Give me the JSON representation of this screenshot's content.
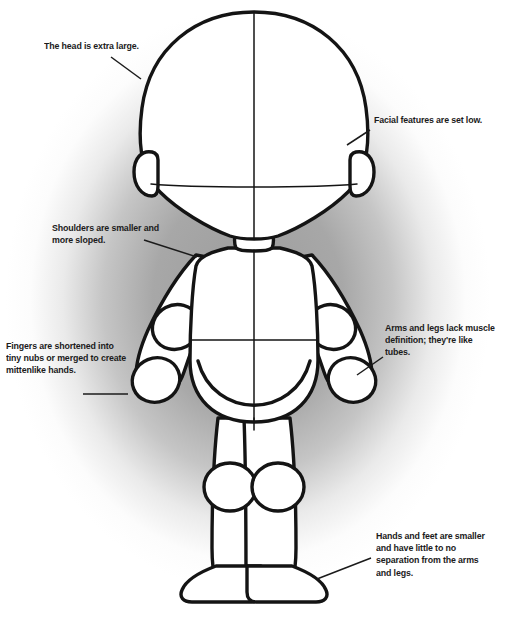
{
  "image": {
    "title": "Chibi proportions reference figure",
    "width": 508,
    "height": 620,
    "background_color": "#ffffff",
    "vignette_color": "#9a9a9a",
    "line_color": "#141414",
    "fill_color": "#ffffff",
    "text_color": "#1b1b1b"
  },
  "callouts": [
    {
      "id": "head",
      "text": "The head is extra large.",
      "side": "left",
      "leader_from": [
        111,
        57
      ],
      "leader_to": [
        139,
        78
      ]
    },
    {
      "id": "facial",
      "text": "Facial features are set low.",
      "side": "right",
      "leader_from": [
        369,
        130
      ],
      "leader_to": [
        350,
        144
      ]
    },
    {
      "id": "shoulders",
      "text": "Shoulders are smaller and\nmore sloped.",
      "side": "left",
      "leader_from": [
        145,
        241
      ],
      "leader_to": [
        196,
        256
      ]
    },
    {
      "id": "fingers",
      "text": "Fingers are shortened into\ntiny nubs or merged to create\nmittenlike hands.",
      "side": "left",
      "leader_from": [
        84,
        394
      ],
      "leader_to": [
        126,
        394
      ]
    },
    {
      "id": "arms",
      "text": "Arms and legs lack muscle\ndefinition; they're like tubes.",
      "side": "right",
      "leader_from": [
        382,
        358
      ],
      "leader_to": [
        355,
        374
      ]
    },
    {
      "id": "hands",
      "text": "Hands and feet are smaller\nand have little to no\nseparation from the arms\nand legs.",
      "side": "right",
      "leader_from": [
        370,
        559
      ],
      "leader_to": [
        316,
        578
      ]
    }
  ],
  "figure_parts": [
    "head-outline",
    "head-vertical-centerline",
    "head-horizontal-eyeline",
    "left-ear",
    "right-ear",
    "neck",
    "torso",
    "torso-waistline",
    "torso-centerline",
    "hips",
    "left-arm",
    "right-arm",
    "left-elbow",
    "right-elbow",
    "left-hand",
    "right-hand",
    "left-leg",
    "right-leg",
    "left-knee",
    "right-knee",
    "left-foot",
    "right-foot"
  ]
}
